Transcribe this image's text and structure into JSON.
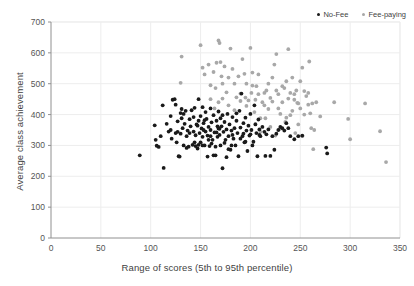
{
  "chart_data": {
    "type": "scatter",
    "title": "",
    "xlabel": "Range of scores (5th to 95th percentile)",
    "ylabel": "Average class achievement",
    "xlim": [
      0,
      350
    ],
    "ylim": [
      0,
      700
    ],
    "xticks": [
      0,
      50,
      100,
      150,
      200,
      250,
      300,
      350
    ],
    "yticks": [
      0,
      100,
      200,
      300,
      400,
      500,
      600,
      700
    ],
    "grid": true,
    "legend_position": "top-right",
    "colors": {
      "no_fee": "#1a1a1a",
      "fee_paying": "#a8a8a8",
      "axis": "#909090",
      "grid": "#ededed",
      "text": "#3f3f3f"
    },
    "series": [
      {
        "name": "No-Fee",
        "color": "#1a1a1a",
        "marker": "circle",
        "points": [
          [
            89,
            268
          ],
          [
            104,
            365
          ],
          [
            105,
            318
          ],
          [
            106,
            299
          ],
          [
            108,
            295
          ],
          [
            110,
            330
          ],
          [
            112,
            430
          ],
          [
            113,
            227
          ],
          [
            118,
            345
          ],
          [
            120,
            395
          ],
          [
            121,
            322
          ],
          [
            122,
            448
          ],
          [
            124,
            450
          ],
          [
            125,
            340
          ],
          [
            126,
            310
          ],
          [
            127,
            378
          ],
          [
            128,
            265
          ],
          [
            129,
            264
          ],
          [
            130,
            405
          ],
          [
            130,
            338
          ],
          [
            131,
            418
          ],
          [
            132,
            356
          ],
          [
            133,
            300
          ],
          [
            134,
            370
          ],
          [
            135,
            412
          ],
          [
            136,
            330
          ],
          [
            137,
            348
          ],
          [
            138,
            296
          ],
          [
            139,
            385
          ],
          [
            140,
            362
          ],
          [
            141,
            414
          ],
          [
            142,
            302
          ],
          [
            143,
            345
          ],
          [
            144,
            422
          ],
          [
            145,
            333
          ],
          [
            146,
            368
          ],
          [
            147,
            290
          ],
          [
            148,
            450
          ],
          [
            148,
            380
          ],
          [
            149,
            340
          ],
          [
            150,
            310
          ],
          [
            150,
            395
          ],
          [
            151,
            355
          ],
          [
            152,
            328
          ],
          [
            153,
            372
          ],
          [
            154,
            300
          ],
          [
            155,
            408
          ],
          [
            155,
            345
          ],
          [
            156,
            386
          ],
          [
            157,
            332
          ],
          [
            158,
            360
          ],
          [
            159,
            298
          ],
          [
            160,
            420
          ],
          [
            160,
            350
          ],
          [
            161,
            375
          ],
          [
            162,
            318
          ],
          [
            163,
            398
          ],
          [
            164,
            342
          ],
          [
            165,
            268
          ],
          [
            166,
            380
          ],
          [
            167,
            328
          ],
          [
            168,
            410
          ],
          [
            168,
            355
          ],
          [
            169,
            334
          ],
          [
            170,
            300
          ],
          [
            170,
            388
          ],
          [
            171,
            362
          ],
          [
            172,
            226
          ],
          [
            173,
            344
          ],
          [
            174,
            376
          ],
          [
            175,
            318
          ],
          [
            176,
            352
          ],
          [
            177,
            402
          ],
          [
            178,
            330
          ],
          [
            179,
            368
          ],
          [
            180,
            286
          ],
          [
            181,
            348
          ],
          [
            182,
            392
          ],
          [
            183,
            322
          ],
          [
            184,
            356
          ],
          [
            185,
            300
          ],
          [
            186,
            380
          ],
          [
            187,
            340
          ],
          [
            188,
            265
          ],
          [
            189,
            412
          ],
          [
            190,
            358
          ],
          [
            191,
            468
          ],
          [
            192,
            330
          ],
          [
            193,
            372
          ],
          [
            194,
            310
          ],
          [
            195,
            390
          ],
          [
            196,
            348
          ],
          [
            197,
            282
          ],
          [
            198,
            364
          ],
          [
            199,
            332
          ],
          [
            200,
            402
          ],
          [
            201,
            350
          ],
          [
            202,
            300
          ],
          [
            203,
            312
          ],
          [
            204,
            430
          ],
          [
            205,
            368
          ],
          [
            206,
            340
          ],
          [
            207,
            265
          ],
          [
            208,
            384
          ],
          [
            209,
            352
          ],
          [
            210,
            330
          ],
          [
            212,
            360
          ],
          [
            214,
            344
          ],
          [
            215,
            266
          ],
          [
            216,
            336
          ],
          [
            218,
            352
          ],
          [
            220,
            266
          ],
          [
            222,
            330
          ],
          [
            224,
            286
          ],
          [
            226,
            338
          ],
          [
            228,
            350
          ],
          [
            230,
            360
          ],
          [
            232,
            356
          ],
          [
            234,
            348
          ],
          [
            236,
            372
          ],
          [
            238,
            356
          ],
          [
            240,
            330
          ],
          [
            244,
            320
          ],
          [
            248,
            330
          ],
          [
            252,
            332
          ],
          [
            276,
            293
          ],
          [
            277,
            274
          ],
          [
            125,
            432
          ],
          [
            133,
            402
          ],
          [
            143,
            392
          ],
          [
            152,
            300
          ],
          [
            161,
            306
          ],
          [
            165,
            296
          ],
          [
            172,
            398
          ],
          [
            178,
            288
          ],
          [
            186,
            404
          ],
          [
            193,
            338
          ],
          [
            152,
            424
          ],
          [
            158,
            318
          ],
          [
            144,
            310
          ],
          [
            136,
            292
          ],
          [
            148,
            302
          ],
          [
            166,
            342
          ],
          [
            176,
            262
          ],
          [
            182,
            334
          ],
          [
            190,
            322
          ],
          [
            200,
            336
          ],
          [
            120,
            350
          ],
          [
            116,
            370
          ],
          [
            163,
            268
          ],
          [
            157,
            264
          ],
          [
            169,
            354
          ],
          [
            174,
            308
          ],
          [
            160,
            330
          ],
          [
            154,
            382
          ],
          [
            147,
            364
          ],
          [
            139,
            340
          ],
          [
            131,
            388
          ],
          [
            127,
            344
          ],
          [
            145,
            298
          ],
          [
            153,
            350
          ],
          [
            167,
            362
          ],
          [
            181,
            300
          ],
          [
            195,
            312
          ],
          [
            209,
            334
          ]
        ]
      },
      {
        "name": "Fee-paying",
        "color": "#a8a8a8",
        "marker": "circle",
        "points": [
          [
            130,
            503
          ],
          [
            131,
            588
          ],
          [
            150,
            625
          ],
          [
            152,
            552
          ],
          [
            154,
            530
          ],
          [
            158,
            562
          ],
          [
            160,
            495
          ],
          [
            163,
            538
          ],
          [
            165,
            486
          ],
          [
            166,
            568
          ],
          [
            168,
            640
          ],
          [
            169,
            632
          ],
          [
            170,
            570
          ],
          [
            171,
            524
          ],
          [
            172,
            500
          ],
          [
            174,
            556
          ],
          [
            176,
            472
          ],
          [
            178,
            520
          ],
          [
            180,
            614
          ],
          [
            182,
            548
          ],
          [
            184,
            500
          ],
          [
            186,
            456
          ],
          [
            188,
            524
          ],
          [
            190,
            468
          ],
          [
            192,
            580
          ],
          [
            194,
            532
          ],
          [
            195,
            455
          ],
          [
            196,
            500
          ],
          [
            198,
            446
          ],
          [
            200,
            616
          ],
          [
            201,
            470
          ],
          [
            202,
            536
          ],
          [
            204,
            408
          ],
          [
            205,
            448
          ],
          [
            206,
            492
          ],
          [
            208,
            466
          ],
          [
            210,
            388
          ],
          [
            212,
            440
          ],
          [
            214,
            430
          ],
          [
            216,
            478
          ],
          [
            218,
            418
          ],
          [
            220,
            454
          ],
          [
            222,
            520
          ],
          [
            224,
            562
          ],
          [
            226,
            596
          ],
          [
            228,
            466
          ],
          [
            230,
            402
          ],
          [
            232,
            440
          ],
          [
            234,
            486
          ],
          [
            236,
            508
          ],
          [
            238,
            612
          ],
          [
            240,
            470
          ],
          [
            242,
            520
          ],
          [
            244,
            448
          ],
          [
            246,
            478
          ],
          [
            248,
            436
          ],
          [
            250,
            508
          ],
          [
            250,
            420
          ],
          [
            252,
            552
          ],
          [
            254,
            400
          ],
          [
            256,
            460
          ],
          [
            258,
            432
          ],
          [
            259,
            572
          ],
          [
            260,
            404
          ],
          [
            261,
            356
          ],
          [
            262,
            436
          ],
          [
            263,
            288
          ],
          [
            264,
            350
          ],
          [
            266,
            440
          ],
          [
            270,
            394
          ],
          [
            284,
            440
          ],
          [
            298,
            386
          ],
          [
            300,
            320
          ],
          [
            315,
            436
          ],
          [
            330,
            346
          ],
          [
            336,
            246
          ],
          [
            205,
            370
          ],
          [
            210,
            344
          ],
          [
            215,
            388
          ],
          [
            220,
            360
          ],
          [
            225,
            332
          ],
          [
            230,
            354
          ],
          [
            235,
            376
          ],
          [
            240,
            398
          ],
          [
            245,
            340
          ],
          [
            248,
            368
          ],
          [
            252,
            330
          ],
          [
            242,
            412
          ],
          [
            236,
            390
          ],
          [
            228,
            420
          ],
          [
            222,
            442
          ],
          [
            218,
            500
          ],
          [
            214,
            470
          ],
          [
            208,
            530
          ],
          [
            202,
            494
          ],
          [
            196,
            428
          ],
          [
            190,
            444
          ],
          [
            184,
            414
          ],
          [
            178,
            430
          ],
          [
            172,
            452
          ],
          [
            168,
            440
          ],
          [
            164,
            420
          ],
          [
            160,
            450
          ],
          [
            254,
            476
          ],
          [
            244,
            466
          ],
          [
            258,
            470
          ],
          [
            232,
            492
          ],
          [
            226,
            478
          ],
          [
            238,
            452
          ],
          [
            247,
            438
          ]
        ]
      }
    ]
  },
  "legend": {
    "items": [
      {
        "label": "No-Fee",
        "color": "#1a1a1a"
      },
      {
        "label": "Fee-paying",
        "color": "#a8a8a8"
      }
    ]
  },
  "axes": {
    "x_title": "Range of scores (5th to 95th percentile)",
    "y_title": "Average class achievement"
  }
}
